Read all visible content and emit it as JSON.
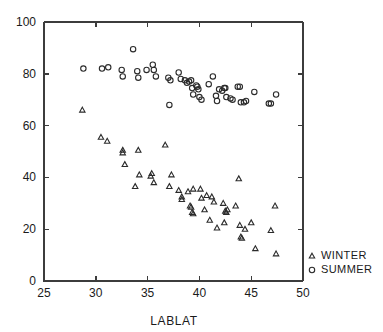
{
  "chart_data": {
    "type": "scatter",
    "title": "",
    "xlabel": "LABLAT",
    "ylabel": "",
    "xlim": [
      25,
      50
    ],
    "ylim": [
      0,
      100
    ],
    "xticks": [
      25,
      30,
      35,
      40,
      45,
      50
    ],
    "yticks": [
      0,
      20,
      40,
      60,
      80,
      100
    ],
    "grid": false,
    "legend_position": "right-bottom",
    "series": [
      {
        "name": "WINTER",
        "marker": "triangle",
        "points": [
          [
            28.7,
            66.0
          ],
          [
            30.5,
            55.5
          ],
          [
            31.1,
            54.0
          ],
          [
            32.6,
            50.5
          ],
          [
            32.6,
            49.5
          ],
          [
            32.8,
            45.0
          ],
          [
            34.1,
            50.5
          ],
          [
            34.2,
            41.0
          ],
          [
            33.8,
            36.5
          ],
          [
            35.3,
            40.5
          ],
          [
            35.4,
            41.5
          ],
          [
            35.6,
            38.0
          ],
          [
            36.7,
            52.5
          ],
          [
            37.3,
            41.0
          ],
          [
            37.1,
            36.5
          ],
          [
            38.0,
            35.0
          ],
          [
            38.3,
            32.5
          ],
          [
            38.3,
            31.5
          ],
          [
            38.9,
            34.5
          ],
          [
            39.1,
            29.0
          ],
          [
            39.2,
            28.5
          ],
          [
            39.4,
            35.5
          ],
          [
            39.3,
            26.5
          ],
          [
            39.4,
            26.0
          ],
          [
            40.1,
            35.5
          ],
          [
            40.2,
            32.0
          ],
          [
            40.7,
            33.0
          ],
          [
            40.5,
            27.5
          ],
          [
            41.2,
            32.5
          ],
          [
            41.4,
            30.5
          ],
          [
            41.0,
            23.5
          ],
          [
            41.7,
            20.5
          ],
          [
            42.3,
            30.0
          ],
          [
            42.5,
            27.0
          ],
          [
            42.6,
            26.5
          ],
          [
            42.7,
            27.5
          ],
          [
            42.4,
            22.5
          ],
          [
            43.8,
            39.5
          ],
          [
            43.5,
            29.0
          ],
          [
            43.9,
            21.5
          ],
          [
            44.0,
            17.0
          ],
          [
            44.1,
            16.5
          ],
          [
            44.4,
            20.0
          ],
          [
            45.0,
            22.5
          ],
          [
            45.4,
            12.5
          ],
          [
            46.9,
            19.5
          ],
          [
            47.3,
            29.0
          ],
          [
            47.4,
            10.5
          ]
        ]
      },
      {
        "name": "SUMMER",
        "marker": "circle",
        "points": [
          [
            28.8,
            82.0
          ],
          [
            30.6,
            82.0
          ],
          [
            31.2,
            82.5
          ],
          [
            32.5,
            81.5
          ],
          [
            32.6,
            79.0
          ],
          [
            33.6,
            89.5
          ],
          [
            34.0,
            81.0
          ],
          [
            34.1,
            78.5
          ],
          [
            34.9,
            81.5
          ],
          [
            35.5,
            83.5
          ],
          [
            35.6,
            81.5
          ],
          [
            35.8,
            79.0
          ],
          [
            37.0,
            78.5
          ],
          [
            37.2,
            77.5
          ],
          [
            37.1,
            68.0
          ],
          [
            38.0,
            80.5
          ],
          [
            38.2,
            78.0
          ],
          [
            38.6,
            77.5
          ],
          [
            38.8,
            76.5
          ],
          [
            39.0,
            77.0
          ],
          [
            39.2,
            77.5
          ],
          [
            39.3,
            74.5
          ],
          [
            39.4,
            72.0
          ],
          [
            39.7,
            75.5
          ],
          [
            39.8,
            75.0
          ],
          [
            39.9,
            74.0
          ],
          [
            40.0,
            71.0
          ],
          [
            40.2,
            70.0
          ],
          [
            40.9,
            76.0
          ],
          [
            41.3,
            79.0
          ],
          [
            41.6,
            71.5
          ],
          [
            41.7,
            69.5
          ],
          [
            41.9,
            74.0
          ],
          [
            42.2,
            73.5
          ],
          [
            42.4,
            74.5
          ],
          [
            42.5,
            74.5
          ],
          [
            42.6,
            71.0
          ],
          [
            43.0,
            70.5
          ],
          [
            43.2,
            70.0
          ],
          [
            43.7,
            75.0
          ],
          [
            43.9,
            75.0
          ],
          [
            44.0,
            69.0
          ],
          [
            44.3,
            69.0
          ],
          [
            44.5,
            69.5
          ],
          [
            45.3,
            73.0
          ],
          [
            46.7,
            68.5
          ],
          [
            46.9,
            68.5
          ],
          [
            47.4,
            72.0
          ]
        ]
      }
    ]
  },
  "legend": {
    "entries": [
      {
        "label": "WINTER",
        "marker": "triangle-marker-icon"
      },
      {
        "label": "SUMMER",
        "marker": "circle-marker-icon"
      }
    ]
  },
  "colors": {
    "marker_stroke": "#2b2b2b",
    "axis": "#3c3c3c",
    "background": "#ffffff",
    "text": "#1a1a1a"
  }
}
